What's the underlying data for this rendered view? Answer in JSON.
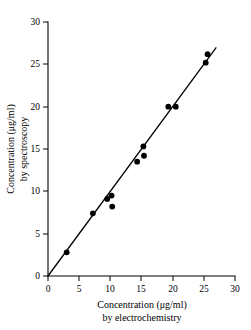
{
  "chart_data": {
    "type": "scatter",
    "title": "",
    "xlabel": "Concentration (μg/ml) by electrochemistry",
    "ylabel": "Concentration (μg/ml) by spectroscopy",
    "xlabel_line1": "Concentration (μg/ml)",
    "xlabel_line2": "by electrochemistry",
    "ylabel_line1": "Concentration (μg/ml)",
    "ylabel_line2": "by spectroscopy",
    "xlim": [
      0,
      30
    ],
    "ylim": [
      0,
      30
    ],
    "xticks": [
      0,
      5,
      10,
      15,
      20,
      25,
      30
    ],
    "yticks": [
      0,
      5,
      10,
      15,
      20,
      25,
      30
    ],
    "xticklabels": [
      "0",
      "5",
      "10",
      "15",
      "20",
      "25",
      "30"
    ],
    "yticklabels": [
      "0",
      "5",
      "10",
      "15",
      "20",
      "25",
      "30"
    ],
    "grid": false,
    "legend": null,
    "marker_color": "#000000",
    "line_color": "#000000",
    "background_color": "#ffffff",
    "points": [
      {
        "x": 3.0,
        "y": 2.8
      },
      {
        "x": 7.2,
        "y": 7.4
      },
      {
        "x": 9.5,
        "y": 9.1
      },
      {
        "x": 10.2,
        "y": 9.5
      },
      {
        "x": 10.3,
        "y": 8.2
      },
      {
        "x": 14.3,
        "y": 13.5
      },
      {
        "x": 15.4,
        "y": 14.2
      },
      {
        "x": 15.3,
        "y": 15.3
      },
      {
        "x": 19.3,
        "y": 20.0
      },
      {
        "x": 20.5,
        "y": 20.0
      },
      {
        "x": 25.3,
        "y": 25.2
      },
      {
        "x": 25.6,
        "y": 26.2
      }
    ],
    "fit_line": {
      "x_start": 0.0,
      "y_start": 0.0,
      "x_end": 27.0,
      "y_end": 27.0,
      "description": "linear regression through origin, slope approximately 1"
    }
  }
}
